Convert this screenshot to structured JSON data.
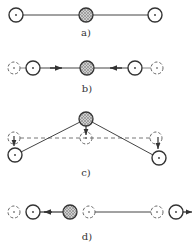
{
  "diagram": {
    "colors": {
      "line": "#444444",
      "shaded_fill": "#bbbbbb",
      "dashed": "#666666"
    },
    "panels": [
      {
        "id": "a",
        "label": "a)",
        "label_pos": [
          86,
          28
        ]
      },
      {
        "id": "b",
        "label": "b)",
        "label_pos": [
          87,
          84
        ]
      },
      {
        "id": "c",
        "label": "c)",
        "label_pos": [
          86,
          168
        ]
      },
      {
        "id": "d",
        "label": "d)",
        "label_pos": [
          87,
          232
        ]
      }
    ]
  }
}
